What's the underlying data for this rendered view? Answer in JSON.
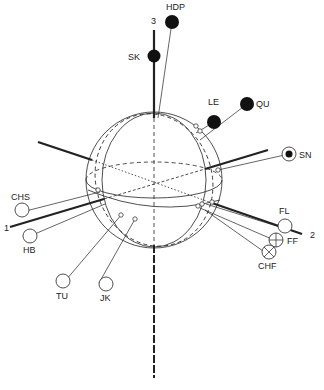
{
  "diagram": {
    "axes": [
      {
        "id": "1",
        "label": "1"
      },
      {
        "id": "2",
        "label": "2"
      },
      {
        "id": "3",
        "label": "3"
      }
    ],
    "points": [
      {
        "id": "HDP",
        "label": "HDP",
        "marker": "filled"
      },
      {
        "id": "SK",
        "label": "SK",
        "marker": "filled"
      },
      {
        "id": "LE",
        "label": "LE",
        "marker": "filled"
      },
      {
        "id": "QU",
        "label": "QU",
        "marker": "filled"
      },
      {
        "id": "SN",
        "label": "SN",
        "marker": "dot-in-circle"
      },
      {
        "id": "CHS",
        "label": "CHS",
        "marker": "open"
      },
      {
        "id": "HB",
        "label": "HB",
        "marker": "open"
      },
      {
        "id": "TU",
        "label": "TU",
        "marker": "open"
      },
      {
        "id": "JK",
        "label": "JK",
        "marker": "open"
      },
      {
        "id": "FL",
        "label": "FL",
        "marker": "open"
      },
      {
        "id": "FF",
        "label": "FF",
        "marker": "crossed"
      },
      {
        "id": "CHF",
        "label": "CHF",
        "marker": "crossed"
      }
    ],
    "colors": {
      "ink": "#222222",
      "background": "#ffffff"
    }
  }
}
